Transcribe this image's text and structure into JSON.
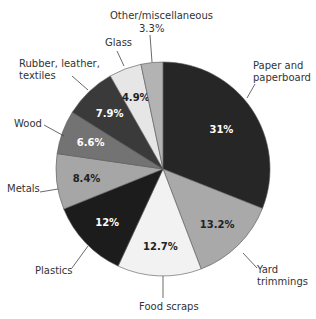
{
  "chart_data": {
    "type": "pie",
    "title": "",
    "start_angle_deg": 0,
    "direction": "clockwise",
    "slices": [
      {
        "label": "Paper and paperboard",
        "value": 31,
        "display": "31%",
        "color": "#262626",
        "text_color": "#ffffff"
      },
      {
        "label": "Yard trimmings",
        "value": 13.2,
        "display": "13.2%",
        "color": "#a9a9a9",
        "text_color": "#222222"
      },
      {
        "label": "Food scraps",
        "value": 12.7,
        "display": "12.7%",
        "color": "#f2f2f2",
        "text_color": "#222222"
      },
      {
        "label": "Plastics",
        "value": 12,
        "display": "12%",
        "color": "#1c1c1c",
        "text_color": "#ffffff"
      },
      {
        "label": "Metals",
        "value": 8.4,
        "display": "8.4%",
        "color": "#a6a6a6",
        "text_color": "#222222"
      },
      {
        "label": "Wood",
        "value": 6.6,
        "display": "6.6%",
        "color": "#737373",
        "text_color": "#ffffff"
      },
      {
        "label": "Rubber, leather, textiles",
        "value": 7.9,
        "display": "7.9%",
        "color": "#3a3a3a",
        "text_color": "#ffffff"
      },
      {
        "label": "Glass",
        "value": 4.9,
        "display": "4.9%",
        "color": "#e6e6e6",
        "text_color": "#222222"
      },
      {
        "label": "Other/miscellaneous",
        "value": 3.3,
        "display": "3.3%",
        "color": "#b3b3b3",
        "text_color": "#222222"
      }
    ],
    "legend": "callout labels"
  },
  "labels": {
    "paper": [
      "Paper and",
      "paperboard"
    ],
    "yard": [
      "Yard",
      "trimmings"
    ],
    "food": "Food scraps",
    "plastics": "Plastics",
    "metals": "Metals",
    "wood": "Wood",
    "rubber": [
      "Rubber, leather,",
      "textiles"
    ],
    "glass": "Glass",
    "other": "Other/miscellaneous",
    "other_value": "3.3%"
  }
}
